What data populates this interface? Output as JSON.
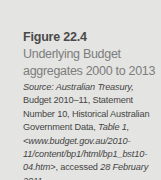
{
  "figure": {
    "label": "Figure 22.4",
    "title_line1": "Underlying Budget",
    "title_line2": "aggregates 2000 to 2013",
    "source": {
      "prefix": "Source:",
      "publisher": " Australian Treasury,",
      "body": " Budget 2010–11, Statement Number 10, Historical Australian Government Data, ",
      "table": "Table 1, <www.budget.gov.au/2010-11/content/bp1/html/bp1_bst10-04.htm>",
      "accessed": ", accessed ",
      "date": "28 February 2011."
    }
  }
}
